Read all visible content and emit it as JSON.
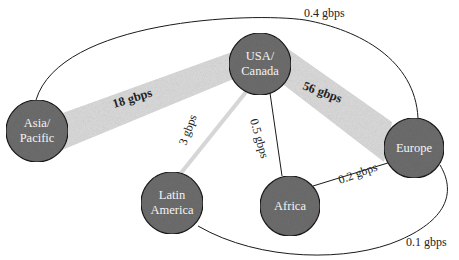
{
  "diagram": {
    "title": "",
    "colors": {
      "node_fill": "#6e6e6e",
      "thick_band": "#dcdcdc",
      "thin_band": "#d6d6d6",
      "line": "#1a1a1a",
      "node_text": "#f4f4f4"
    },
    "nodes": [
      {
        "id": "usa",
        "lines": [
          "USA/",
          "Canada"
        ],
        "cx": 260,
        "cy": 64,
        "r": 31
      },
      {
        "id": "asia",
        "lines": [
          "Asia/",
          "Pacific"
        ],
        "cx": 37,
        "cy": 131,
        "r": 31
      },
      {
        "id": "europe",
        "lines": [
          "Europe"
        ],
        "cx": 414,
        "cy": 148,
        "r": 30
      },
      {
        "id": "latam",
        "lines": [
          "Latin",
          "America"
        ],
        "cx": 172,
        "cy": 203,
        "r": 31
      },
      {
        "id": "africa",
        "lines": [
          "Africa"
        ],
        "cx": 290,
        "cy": 206,
        "r": 30
      }
    ],
    "links": [
      {
        "from": "asia",
        "to": "usa",
        "label": "18 gbps",
        "style": "thick-band"
      },
      {
        "from": "usa",
        "to": "europe",
        "label": "56 gbps",
        "style": "thick-band"
      },
      {
        "from": "usa",
        "to": "latam",
        "label": "3 gbps",
        "style": "thin-band"
      },
      {
        "from": "usa",
        "to": "africa",
        "label": "0.5 gbps",
        "style": "line"
      },
      {
        "from": "africa",
        "to": "europe",
        "label": "0.2 gbps",
        "style": "line"
      },
      {
        "from": "asia",
        "to": "europe",
        "label": "0.4 gbps",
        "style": "arc-top"
      },
      {
        "from": "latam",
        "to": "europe",
        "label": "0.1 gbps",
        "style": "arc-bottom"
      }
    ]
  }
}
